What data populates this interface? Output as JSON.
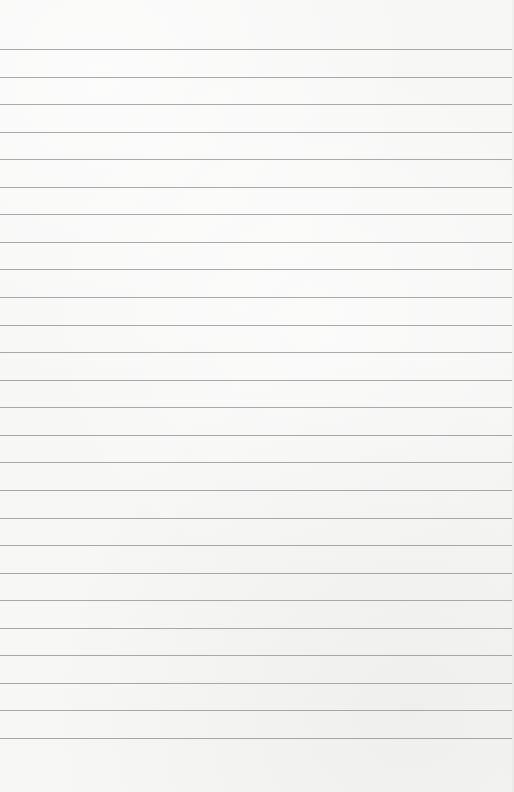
{
  "page": {
    "type": "lined-paper",
    "background_color": "#f7f7f6",
    "rule_color": "#9a9a9a",
    "rule_count": 26,
    "first_rule_y": 49,
    "rule_spacing": 27.56,
    "text": ""
  }
}
